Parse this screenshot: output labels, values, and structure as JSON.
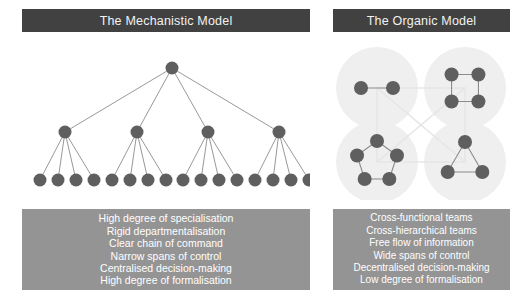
{
  "colors": {
    "header_bg": "#414141",
    "header_text": "#f2f2f2",
    "panel_bg": "#949494",
    "panel_text": "#ffffff",
    "node_fill": "#5f5f5f",
    "edge_stroke": "#8c8c8c",
    "cluster_halo": "#efefef",
    "cluster_link": "#e6e6e6",
    "page_bg": "#ffffff"
  },
  "panels": {
    "mechanistic": {
      "title": "The Mechanistic Model",
      "attributes": [
        "High degree of specialisation",
        "Rigid departmentalisation",
        "Clear chain of command",
        "Narrow spans of control",
        "Centralised decision-making",
        "High degree of formalisation"
      ]
    },
    "organic": {
      "title": "The Organic Model",
      "attributes": [
        "Cross-functional teams",
        "Cross-hierarchical teams",
        "Free flow of information",
        "Wide spans of control",
        "Decentralised decision-making",
        "Low degree of formalisation"
      ]
    }
  },
  "chart_data": {
    "type": "diagram",
    "diagrams": [
      {
        "name": "mechanistic-hierarchy-tree",
        "structure": "hierarchical tree",
        "levels": 3,
        "node_counts": [
          1,
          4,
          16
        ],
        "branching_factor": 4,
        "node_radius": 6.5,
        "total_nodes": 21,
        "root": {
          "x": 150,
          "y": 28
        },
        "middle": [
          {
            "x": 43,
            "y": 92
          },
          {
            "x": 115,
            "y": 92
          },
          {
            "x": 186,
            "y": 92
          },
          {
            "x": 257,
            "y": 92
          }
        ],
        "leaves": [
          {
            "x": 18,
            "y": 140
          },
          {
            "x": 36,
            "y": 140
          },
          {
            "x": 54,
            "y": 140
          },
          {
            "x": 72,
            "y": 140
          },
          {
            "x": 90,
            "y": 140
          },
          {
            "x": 108,
            "y": 140
          },
          {
            "x": 126,
            "y": 140
          },
          {
            "x": 144,
            "y": 140
          },
          {
            "x": 161,
            "y": 140
          },
          {
            "x": 179,
            "y": 140
          },
          {
            "x": 197,
            "y": 140
          },
          {
            "x": 215,
            "y": 140
          },
          {
            "x": 233,
            "y": 140
          },
          {
            "x": 251,
            "y": 140
          },
          {
            "x": 269,
            "y": 140
          },
          {
            "x": 287,
            "y": 140
          }
        ]
      },
      {
        "name": "organic-network-clusters",
        "structure": "network of interconnected clusters",
        "cluster_count": 4,
        "total_nodes": 14,
        "node_radius": 7,
        "halo_radius": 41,
        "clusters": [
          {
            "id": "top-left",
            "shape": "dyad",
            "node_count": 2,
            "center": {
              "x": 44,
              "y": 48
            }
          },
          {
            "id": "top-right",
            "shape": "square",
            "node_count": 4,
            "center": {
              "x": 132,
              "y": 48
            }
          },
          {
            "id": "bottom-left",
            "shape": "pentagon",
            "node_count": 5,
            "center": {
              "x": 44,
              "y": 122
            }
          },
          {
            "id": "bottom-right",
            "shape": "triangle",
            "node_count": 3,
            "center": {
              "x": 132,
              "y": 122
            }
          }
        ],
        "inter_cluster_links": [
          "top-left -- top-right",
          "top-left -- bottom-left",
          "top-right -- bottom-right",
          "bottom-left -- bottom-right",
          "top-left -- bottom-right",
          "top-right -- bottom-left"
        ]
      }
    ]
  }
}
